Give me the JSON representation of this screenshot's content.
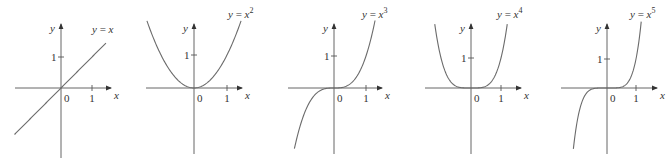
{
  "chart_data": [
    {
      "type": "line",
      "title": "y = x",
      "equation": {
        "lhs": "y",
        "rhs_base": "x",
        "exponent": ""
      },
      "xlabel": "x",
      "ylabel": "y",
      "origin_label": "0",
      "x_ticks": [
        "1"
      ],
      "y_ticks": [
        "1"
      ],
      "function": "x",
      "power": 1,
      "xlim": [
        -1.6,
        1.6
      ],
      "ylim": [
        -1.6,
        1.6
      ],
      "grid": false,
      "x": [
        -1.5,
        -1,
        -0.5,
        0,
        0.5,
        1,
        1.5
      ],
      "values": [
        -1.5,
        -1,
        -0.5,
        0,
        0.5,
        1,
        1.5
      ]
    },
    {
      "type": "line",
      "title": "y = x^2",
      "equation": {
        "lhs": "y",
        "rhs_base": "x",
        "exponent": "2"
      },
      "xlabel": "x",
      "ylabel": "y",
      "origin_label": "0",
      "x_ticks": [
        "1"
      ],
      "y_ticks": [
        "1"
      ],
      "function": "x^2",
      "power": 2,
      "xlim": [
        -1.6,
        1.6
      ],
      "ylim": [
        -2.4,
        2.0
      ],
      "grid": false,
      "x": [
        -1.4,
        -1,
        -0.5,
        0,
        0.5,
        1,
        1.4
      ],
      "values": [
        1.96,
        1,
        0.25,
        0,
        0.25,
        1,
        1.96
      ]
    },
    {
      "type": "line",
      "title": "y = x^3",
      "equation": {
        "lhs": "y",
        "rhs_base": "x",
        "exponent": "3"
      },
      "xlabel": "x",
      "ylabel": "y",
      "origin_label": "0",
      "x_ticks": [
        "1"
      ],
      "y_ticks": [
        "1"
      ],
      "function": "x^3",
      "power": 3,
      "xlim": [
        -1.6,
        1.6
      ],
      "ylim": [
        -2.3,
        2.0
      ],
      "grid": false,
      "x": [
        -1.3,
        -1,
        -0.5,
        0,
        0.5,
        1,
        1.3
      ],
      "values": [
        -2.2,
        -1,
        -0.125,
        0,
        0.125,
        1,
        2.2
      ]
    },
    {
      "type": "line",
      "title": "y = x^4",
      "equation": {
        "lhs": "y",
        "rhs_base": "x",
        "exponent": "4"
      },
      "xlabel": "x",
      "ylabel": "y",
      "origin_label": "0",
      "x_ticks": [
        "1"
      ],
      "y_ticks": [
        "1"
      ],
      "function": "x^4",
      "power": 4,
      "xlim": [
        -1.6,
        1.6
      ],
      "ylim": [
        -2.4,
        2.0
      ],
      "grid": false,
      "x": [
        -1.2,
        -1,
        -0.5,
        0,
        0.5,
        1,
        1.2
      ],
      "values": [
        2.07,
        1,
        0.0625,
        0,
        0.0625,
        1,
        2.07
      ]
    },
    {
      "type": "line",
      "title": "y = x^5",
      "equation": {
        "lhs": "y",
        "rhs_base": "x",
        "exponent": "5"
      },
      "xlabel": "x",
      "ylabel": "y",
      "origin_label": "0",
      "x_ticks": [
        "1"
      ],
      "y_ticks": [
        "1"
      ],
      "function": "x^5",
      "power": 5,
      "xlim": [
        -1.6,
        1.6
      ],
      "ylim": [
        -2.3,
        2.0
      ],
      "grid": false,
      "x": [
        -1.17,
        -1,
        -0.5,
        0,
        0.5,
        1,
        1.17
      ],
      "values": [
        -2.2,
        -1,
        -0.03,
        0,
        0.03,
        1,
        2.2
      ]
    }
  ],
  "layout": {
    "panels": [
      {
        "ox": 61,
        "oy": 88,
        "unit": 31,
        "xmin": -46,
        "xmax": 50,
        "ytop": -64,
        "ybot": 70,
        "clip_top": -58,
        "clip_bot": 48,
        "label_x": 92,
        "label_y": 33,
        "curve_range": [
          -1.5,
          1.45
        ]
      },
      {
        "ox": 194,
        "oy": 88,
        "unit": 33,
        "xmin": -48,
        "xmax": 48,
        "ytop": -64,
        "ybot": 66,
        "clip_top": -66,
        "clip_bot": 66,
        "label_x": 228,
        "label_y": 18,
        "curve_range": [
          -1.45,
          1.45
        ]
      },
      {
        "ox": 334,
        "oy": 88,
        "unit": 32,
        "xmin": -46,
        "xmax": 48,
        "ytop": -64,
        "ybot": 66,
        "clip_top": -66,
        "clip_bot": 62,
        "label_x": 362,
        "label_y": 18,
        "curve_range": [
          -1.35,
          1.35
        ]
      },
      {
        "ox": 471,
        "oy": 88,
        "unit": 30,
        "xmin": -46,
        "xmax": 50,
        "ytop": -64,
        "ybot": 66,
        "clip_top": -66,
        "clip_bot": 66,
        "label_x": 497,
        "label_y": 18,
        "curve_range": [
          -1.25,
          1.25
        ]
      },
      {
        "ox": 607,
        "oy": 88,
        "unit": 29,
        "xmin": -46,
        "xmax": 50,
        "ytop": -64,
        "ybot": 66,
        "clip_top": -66,
        "clip_bot": 62,
        "label_x": 630,
        "label_y": 18,
        "curve_range": [
          -1.2,
          1.2
        ]
      }
    ],
    "colors": {
      "axis": "#555555",
      "curve": "#6b6b6b",
      "text": "#333333",
      "background": "#ffffff"
    }
  }
}
